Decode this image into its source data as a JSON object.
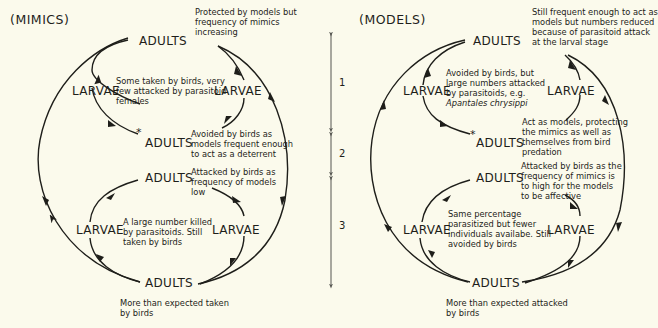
{
  "colors": {
    "background": "#fbfaec",
    "ink": "#1e1e1a",
    "scale": "#555550"
  },
  "mimics": {
    "title": "(MIMICS)",
    "stages": {
      "top_adults": "ADULTS",
      "upper_left_larvae": "LARVAE",
      "upper_right_larvae": "LARVAE",
      "mid_adults": "ADULTS",
      "mid_star": "*",
      "lower_adults": "ADULTS",
      "lower_left_larvae": "LARVAE",
      "lower_right_larvae": "LARVAE",
      "bottom_adults": "ADULTS"
    },
    "notes": {
      "top": "Protected by models but\nfrequency of mimics\nincreasing",
      "upper_center": "Some taken by birds, very\nfew attacked by parasitoid\nfemales",
      "mid": "Avoided by birds as\nmodels frequent enough\nto act as a deterrent",
      "lower": "Attacked by birds as\nfrequency of models\nlow",
      "lower_center": "A large number killed\nby parasitoids. Still\ntaken by birds",
      "bottom": "More than expected taken\nby birds"
    }
  },
  "models": {
    "title": "(MODELS)",
    "stages": {
      "top_adults": "ADULTS",
      "upper_left_larvae": "LARVAE",
      "upper_right_larvae": "LARVAE",
      "mid_adults": "ADULTS",
      "mid_star": "*",
      "lower_adults": "ADULTS",
      "lower_left_larvae": "LARVAE",
      "lower_right_larvae": "LARVAE",
      "bottom_adults": "ADULTS"
    },
    "notes": {
      "top": "Still frequent enough to act as\nmodels but numbers reduced\nbecause of parasitoid attack\nat the larval stage",
      "upper_center": "Avoided by birds, but\nlarge numbers attacked\nby parasitoids, e.g.",
      "upper_center_species": "Apantales chrysippi",
      "mid": "Act as models, protecting\nthe mimics as well as\nthemselves from bird\npredation",
      "lower": "Attacked by birds as the\nfrequency of mimics is\nto high for the models\nto be affective",
      "lower_center": "Same percentage\nparasitized but fewer\nindividuals availabe. Still\navoided by birds",
      "bottom": "More than expected attacked\nby birds"
    }
  },
  "scale_bar": {
    "segments": [
      {
        "label": "1"
      },
      {
        "label": "2"
      },
      {
        "label": "3"
      }
    ]
  }
}
